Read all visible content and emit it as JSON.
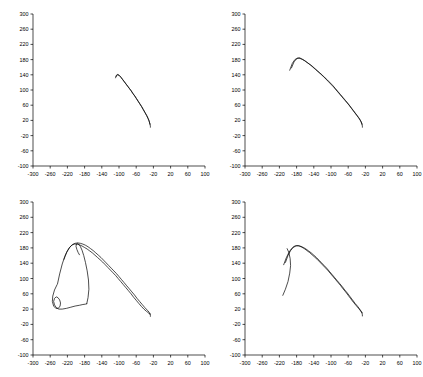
{
  "figure": {
    "layout": "2x2 grid of line plots",
    "panel_count": 4
  },
  "chart_data": [
    {
      "type": "line",
      "title": "",
      "xlabel": "",
      "ylabel": "",
      "xlim": [
        -300,
        100
      ],
      "ylim": [
        -100,
        300
      ],
      "xticks": [
        -300,
        -260,
        -220,
        -180,
        -140,
        -100,
        -60,
        -20,
        20,
        60,
        100
      ],
      "yticks": [
        -100,
        -60,
        -20,
        20,
        60,
        100,
        140,
        180,
        220,
        260,
        300
      ],
      "xticklabels": [
        "-300",
        "-260",
        "-220",
        "-180",
        "-140",
        "-100",
        "-60",
        "-20",
        "20",
        "60",
        "100"
      ],
      "yticklabels": [
        "-100",
        "-60",
        "-20",
        "20",
        "60",
        "100",
        "140",
        "180",
        "220",
        "260",
        "300"
      ],
      "grid": false,
      "legend": "none",
      "series": [
        {
          "name": "trace-1",
          "x": [
            -108,
            -106,
            -103,
            -99,
            -95,
            -91,
            -87,
            -83,
            -79,
            -75,
            -71,
            -67,
            -63,
            -59,
            -55,
            -51,
            -47,
            -43,
            -39,
            -35,
            -32,
            -30,
            -29,
            -28
          ],
          "y": [
            132,
            139,
            141,
            138,
            133,
            127,
            121,
            115,
            109,
            103,
            97,
            90,
            84,
            77,
            70,
            63,
            56,
            48,
            40,
            32,
            25,
            19,
            14,
            10
          ]
        },
        {
          "name": "trace-2",
          "x": [
            -107,
            -104,
            -100,
            -96,
            -92,
            -88,
            -84,
            -80,
            -76,
            -72,
            -68,
            -64,
            -60,
            -56,
            -52,
            -48,
            -44,
            -40,
            -36,
            -33,
            -30,
            -28
          ],
          "y": [
            135,
            140,
            139,
            134,
            128,
            122,
            116,
            110,
            104,
            98,
            91,
            85,
            78,
            71,
            64,
            57,
            49,
            41,
            33,
            26,
            18,
            11
          ]
        },
        {
          "name": "trace-3",
          "x": [
            -28,
            -27,
            -27
          ],
          "y": [
            10,
            5,
            2
          ]
        }
      ]
    },
    {
      "type": "line",
      "title": "",
      "xlabel": "",
      "ylabel": "",
      "xlim": [
        -300,
        100
      ],
      "ylim": [
        -100,
        300
      ],
      "xticks": [
        -300,
        -260,
        -220,
        -180,
        -140,
        -100,
        -60,
        -20,
        20,
        60,
        100
      ],
      "yticks": [
        -100,
        -60,
        -20,
        20,
        60,
        100,
        140,
        180,
        220,
        260,
        300
      ],
      "xticklabels": [
        "-300",
        "-260",
        "-220",
        "-180",
        "-140",
        "-100",
        "-60",
        "-20",
        "20",
        "60",
        "100"
      ],
      "yticklabels": [
        "-100",
        "-60",
        "-20",
        "20",
        "60",
        "100",
        "140",
        "180",
        "220",
        "260",
        "300"
      ],
      "grid": false,
      "legend": "none",
      "series": [
        {
          "name": "trace-1",
          "x": [
            -196,
            -190,
            -184,
            -178,
            -172,
            -166,
            -160,
            -154,
            -148,
            -142,
            -136,
            -130,
            -124,
            -118,
            -112,
            -106,
            -100,
            -94,
            -88,
            -82,
            -76,
            -70,
            -64,
            -58,
            -52,
            -46,
            -40,
            -34,
            -30,
            -28
          ],
          "y": [
            152,
            170,
            180,
            184,
            183,
            180,
            176,
            171,
            166,
            160,
            154,
            148,
            142,
            136,
            129,
            122,
            115,
            108,
            100,
            92,
            84,
            76,
            68,
            60,
            51,
            42,
            33,
            24,
            16,
            10
          ]
        },
        {
          "name": "trace-2",
          "x": [
            -192,
            -186,
            -180,
            -174,
            -168,
            -162,
            -156,
            -150,
            -144,
            -138,
            -132,
            -126,
            -120,
            -114,
            -108,
            -102,
            -96,
            -90,
            -84,
            -78,
            -72,
            -66,
            -60,
            -54,
            -48,
            -42,
            -36,
            -31,
            -28
          ],
          "y": [
            158,
            174,
            182,
            185,
            182,
            178,
            173,
            168,
            163,
            157,
            151,
            145,
            139,
            132,
            126,
            119,
            112,
            104,
            96,
            88,
            80,
            72,
            64,
            55,
            46,
            37,
            28,
            19,
            11
          ]
        },
        {
          "name": "trace-3",
          "x": [
            -28,
            -27,
            -27
          ],
          "y": [
            10,
            5,
            2
          ]
        }
      ]
    },
    {
      "type": "line",
      "title": "",
      "xlabel": "",
      "ylabel": "",
      "xlim": [
        -300,
        100
      ],
      "ylim": [
        -100,
        300
      ],
      "xticks": [
        -300,
        -260,
        -220,
        -180,
        -140,
        -100,
        -60,
        -20,
        20,
        60,
        100
      ],
      "yticks": [
        -100,
        -60,
        -20,
        20,
        60,
        100,
        140,
        180,
        220,
        260,
        300
      ],
      "xticklabels": [
        "-300",
        "-260",
        "-220",
        "-180",
        "-140",
        "-100",
        "-60",
        "-20",
        "20",
        "60",
        "100"
      ],
      "yticklabels": [
        "-100",
        "-60",
        "-20",
        "20",
        "60",
        "100",
        "140",
        "180",
        "220",
        "260",
        "300"
      ],
      "grid": false,
      "legend": "none",
      "series": [
        {
          "name": "trace-outer-loop",
          "x": [
            -243,
            -238,
            -232,
            -226,
            -220,
            -214,
            -208,
            -202,
            -196,
            -190,
            -184,
            -178,
            -172,
            -166,
            -160,
            -154,
            -148,
            -142,
            -136,
            -130,
            -124,
            -118,
            -112,
            -106,
            -100,
            -94,
            -88,
            -82,
            -76,
            -70,
            -64,
            -58,
            -52,
            -46,
            -40,
            -34,
            -30,
            -28
          ],
          "y": [
            86,
            112,
            138,
            158,
            172,
            182,
            189,
            192,
            193,
            192,
            190,
            187,
            183,
            178,
            173,
            167,
            161,
            155,
            148,
            141,
            134,
            127,
            120,
            113,
            105,
            97,
            89,
            81,
            73,
            65,
            57,
            48,
            40,
            32,
            24,
            17,
            12,
            8
          ]
        },
        {
          "name": "trace-inner-loop",
          "x": [
            -228,
            -222,
            -216,
            -210,
            -204,
            -198,
            -192,
            -186,
            -180,
            -174,
            -168,
            -162,
            -156,
            -150,
            -144,
            -138,
            -132,
            -126,
            -120,
            -114,
            -108,
            -102,
            -96,
            -90,
            -84,
            -78,
            -72,
            -66,
            -60,
            -54,
            -48,
            -42,
            -36,
            -31,
            -28
          ],
          "y": [
            150,
            168,
            180,
            187,
            190,
            190,
            188,
            185,
            181,
            177,
            172,
            167,
            161,
            155,
            149,
            143,
            136,
            129,
            122,
            115,
            108,
            100,
            92,
            84,
            76,
            68,
            60,
            51,
            43,
            35,
            27,
            20,
            14,
            10,
            6
          ]
        },
        {
          "name": "trace-spiral",
          "x": [
            -244,
            -250,
            -254,
            -255,
            -252,
            -247,
            -241,
            -237,
            -236,
            -238,
            -242,
            -246,
            -250,
            -252,
            -250,
            -246,
            -240,
            -232,
            -222,
            -212,
            -202,
            -192,
            -184,
            -178,
            -175
          ],
          "y": [
            84,
            70,
            54,
            40,
            28,
            22,
            22,
            28,
            36,
            44,
            50,
            52,
            48,
            40,
            31,
            24,
            20,
            20,
            22,
            25,
            28,
            30,
            32,
            33,
            34
          ]
        },
        {
          "name": "trace-ridge",
          "x": [
            -175,
            -172,
            -170,
            -171,
            -174,
            -178,
            -182,
            -186,
            -190,
            -194,
            -197,
            -199,
            -200,
            -198,
            -195,
            -192
          ],
          "y": [
            34,
            50,
            72,
            96,
            120,
            142,
            160,
            174,
            184,
            190,
            192,
            190,
            184,
            176,
            168,
            162
          ]
        },
        {
          "name": "trace-tail",
          "x": [
            -28,
            -27,
            -27
          ],
          "y": [
            8,
            4,
            1
          ]
        }
      ]
    },
    {
      "type": "line",
      "title": "",
      "xlabel": "",
      "ylabel": "",
      "xlim": [
        -300,
        100
      ],
      "ylim": [
        -100,
        300
      ],
      "xticks": [
        -300,
        -260,
        -220,
        -180,
        -140,
        -100,
        -60,
        -20,
        20,
        60,
        100
      ],
      "yticks": [
        -100,
        -60,
        -20,
        20,
        60,
        100,
        140,
        180,
        220,
        260,
        300
      ],
      "xticklabels": [
        "-300",
        "-260",
        "-220",
        "-180",
        "-140",
        "-100",
        "-60",
        "-20",
        "20",
        "60",
        "100"
      ],
      "yticklabels": [
        "-100",
        "-60",
        "-20",
        "20",
        "60",
        "100",
        "140",
        "180",
        "220",
        "260",
        "300"
      ],
      "grid": false,
      "legend": "none",
      "series": [
        {
          "name": "trace-1",
          "x": [
            -210,
            -204,
            -198,
            -192,
            -186,
            -180,
            -174,
            -168,
            -162,
            -156,
            -150,
            -144,
            -138,
            -132,
            -126,
            -120,
            -114,
            -108,
            -102,
            -96,
            -90,
            -84,
            -78,
            -72,
            -66,
            -60,
            -54,
            -48,
            -42,
            -36,
            -31,
            -28
          ],
          "y": [
            136,
            154,
            168,
            178,
            184,
            186,
            185,
            182,
            178,
            173,
            168,
            162,
            156,
            150,
            143,
            136,
            129,
            122,
            114,
            106,
            98,
            90,
            82,
            73,
            65,
            56,
            47,
            38,
            30,
            22,
            15,
            10
          ]
        },
        {
          "name": "trace-2",
          "x": [
            -206,
            -200,
            -194,
            -188,
            -182,
            -176,
            -170,
            -164,
            -158,
            -152,
            -146,
            -140,
            -134,
            -128,
            -122,
            -116,
            -110,
            -104,
            -98,
            -92,
            -86,
            -80,
            -74,
            -68,
            -62,
            -56,
            -50,
            -44,
            -38,
            -32,
            -28
          ],
          "y": [
            142,
            160,
            173,
            181,
            185,
            186,
            184,
            181,
            177,
            172,
            167,
            161,
            155,
            148,
            141,
            134,
            127,
            119,
            111,
            103,
            95,
            87,
            79,
            70,
            62,
            53,
            44,
            35,
            27,
            18,
            11
          ]
        },
        {
          "name": "trace-left-tail",
          "x": [
            -212,
            -206,
            -200,
            -196,
            -194,
            -195,
            -198,
            -202
          ],
          "y": [
            56,
            72,
            92,
            114,
            134,
            152,
            168,
            178
          ]
        },
        {
          "name": "trace-tail",
          "x": [
            -28,
            -27,
            -27
          ],
          "y": [
            10,
            5,
            2
          ]
        }
      ]
    }
  ]
}
